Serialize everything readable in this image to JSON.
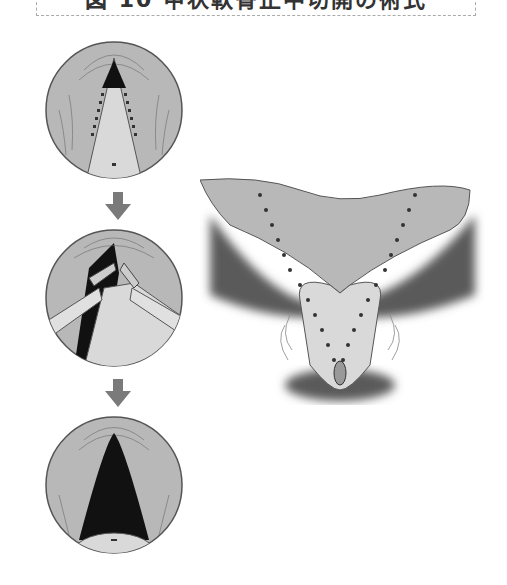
{
  "figure": {
    "title": "図 10 甲状軟骨正中切開の術式",
    "title_truncated": true,
    "steps": [
      {
        "id": "step-1",
        "description": "Endoscopic view: closed glottis with dotted incision lines along vocal folds"
      },
      {
        "id": "step-2",
        "description": "Endoscopic view: incision performed with instruments retracting tissue"
      },
      {
        "id": "step-3",
        "description": "Endoscopic view: widened triangular airway after procedure"
      }
    ],
    "arrows": [
      "down-arrow",
      "down-arrow"
    ],
    "side_view": {
      "description": "Anatomical illustration of larynx/epiglottis with V-shaped dotted incision lines"
    }
  },
  "colors": {
    "tissue": "#b8b8b8",
    "tissue_light": "#d9d9d9",
    "shadow": "#5a5a5a",
    "airway": "#111111",
    "arrow": "#7a7a7a",
    "dots": "#333333",
    "outline": "#555555"
  }
}
